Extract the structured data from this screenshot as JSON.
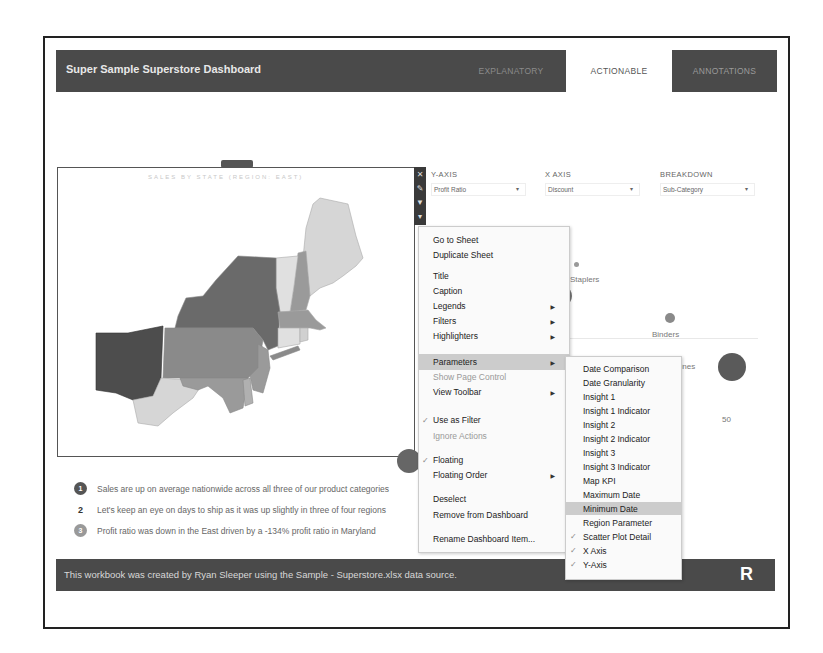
{
  "header": {
    "title": "Super Sample Superstore Dashboard",
    "tabs": [
      {
        "label": "EXPLANATORY",
        "active": false
      },
      {
        "label": "ACTIONABLE",
        "active": true
      },
      {
        "label": "ANNOTATIONS",
        "active": false
      }
    ]
  },
  "map": {
    "title": "SALES BY STATE (REGION: EAST)",
    "toolbar_icons": [
      "close-icon",
      "edit-icon",
      "filter-icon",
      "more-options-icon"
    ]
  },
  "parameters": [
    {
      "label": "Y-AXIS",
      "value": "Profit Ratio"
    },
    {
      "label": "X AXIS",
      "value": "Discount"
    },
    {
      "label": "BREAKDOWN",
      "value": "Sub-Category"
    }
  ],
  "scatter": {
    "labels": {
      "staplers": "Staplers",
      "binders": "Binders",
      "machines": "Machines"
    },
    "axis_value": "50"
  },
  "insights": [
    {
      "num": "1",
      "text": "Sales are up on average nationwide across all three of our product categories"
    },
    {
      "num": "2",
      "text": "Let's keep an eye on days to ship as it was up slightly in three of four regions"
    },
    {
      "num": "3",
      "text": "Profit ratio was down in the East driven by a -134% profit ratio in Maryland"
    }
  ],
  "context_menu": {
    "items": [
      {
        "label": "Go to Sheet"
      },
      {
        "label": "Duplicate Sheet"
      },
      {
        "label": "Title"
      },
      {
        "label": "Caption"
      },
      {
        "label": "Legends",
        "submenu": true
      },
      {
        "label": "Filters",
        "submenu": true
      },
      {
        "label": "Highlighters",
        "submenu": true
      },
      {
        "label": "Parameters",
        "submenu": true,
        "highlighted": true
      },
      {
        "label": "Show Page Control",
        "disabled": true
      },
      {
        "label": "View Toolbar",
        "submenu": true
      },
      {
        "label": "Use as Filter",
        "checked": true
      },
      {
        "label": "Ignore Actions",
        "disabled": true
      },
      {
        "label": "Floating",
        "checked": true
      },
      {
        "label": "Floating Order",
        "submenu": true
      },
      {
        "label": "Deselect"
      },
      {
        "label": "Remove from Dashboard"
      },
      {
        "label": "Rename Dashboard Item..."
      }
    ]
  },
  "parameters_submenu": {
    "items": [
      {
        "label": "Date Comparison"
      },
      {
        "label": "Date Granularity"
      },
      {
        "label": "Insight 1"
      },
      {
        "label": "Insight 1 Indicator"
      },
      {
        "label": "Insight 2"
      },
      {
        "label": "Insight 2 Indicator"
      },
      {
        "label": "Insight 3"
      },
      {
        "label": "Insight 3 Indicator"
      },
      {
        "label": "Map KPI"
      },
      {
        "label": "Maximum Date"
      },
      {
        "label": "Minimum Date",
        "highlighted": true
      },
      {
        "label": "Region Parameter"
      },
      {
        "label": "Scatter Plot Detail",
        "checked": true
      },
      {
        "label": "X Axis",
        "checked": true
      },
      {
        "label": "Y-Axis",
        "checked": true
      }
    ]
  },
  "footer": {
    "text": "This workbook was created by Ryan Sleeper using the Sample - Superstore.xlsx data source.",
    "logo": "R"
  },
  "colors": {
    "header_bg": "#4a4a4a",
    "menu_highlight": "#cccccc",
    "map_dark": "#4d4d4d",
    "map_mid": "#8a8a8a",
    "map_light": "#d6d6d6"
  }
}
